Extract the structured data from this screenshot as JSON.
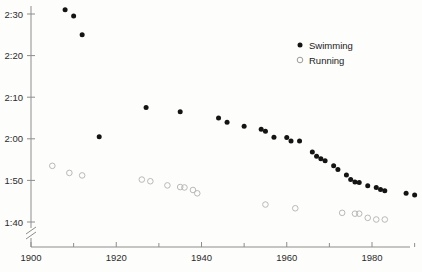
{
  "chart_data": {
    "type": "scatter",
    "title": "",
    "subtitle": "",
    "xlabel": "",
    "ylabel": "",
    "xlim": [
      1900,
      1992
    ],
    "ylim_seconds": [
      98,
      152
    ],
    "y_axis_break": true,
    "y_axis_break_note": "axis broken below 1:40",
    "grid": false,
    "legend_position": "top-right",
    "y_tick_labels": [
      "2:30",
      "2:20",
      "2:10",
      "2:00",
      "1:50",
      "1:40"
    ],
    "y_tick_seconds": [
      150,
      140,
      130,
      120,
      110,
      100
    ],
    "x_tick_labels": [
      "1900",
      "1920",
      "1940",
      "1960",
      "1980"
    ],
    "x_tick_values": [
      1900,
      1920,
      1940,
      1960,
      1980
    ],
    "x_minor_ticks": [
      1910,
      1930,
      1950,
      1970,
      1990
    ],
    "series": [
      {
        "name": "Swimming",
        "marker": "filled-circle",
        "color": "#141414",
        "points": [
          {
            "x": 1908,
            "y_label": "2:31",
            "y": 151.0
          },
          {
            "x": 1910,
            "y_label": "2:29",
            "y": 149.5
          },
          {
            "x": 1912,
            "y_label": "2:25",
            "y": 145.0
          },
          {
            "x": 1916,
            "y_label": "2:20",
            "y": 120.5
          },
          {
            "x": 1927,
            "y_label": "2:07",
            "y": 127.5
          },
          {
            "x": 1935,
            "y_label": "2:06",
            "y": 126.5
          },
          {
            "x": 1944,
            "y_label": "2:05",
            "y": 125.0
          },
          {
            "x": 1946,
            "y_label": "2:04",
            "y": 124.0
          },
          {
            "x": 1950,
            "y_label": "2:03",
            "y": 123.0
          },
          {
            "x": 1954,
            "y_label": "2:02",
            "y": 122.3
          },
          {
            "x": 1955,
            "y_label": "2:02",
            "y": 121.8
          },
          {
            "x": 1957,
            "y_label": "2:00",
            "y": 120.4
          },
          {
            "x": 1960,
            "y_label": "2:00",
            "y": 120.3
          },
          {
            "x": 1961,
            "y_label": "1:59",
            "y": 119.5
          },
          {
            "x": 1963,
            "y_label": "1:59",
            "y": 119.5
          },
          {
            "x": 1966,
            "y_label": "1:57",
            "y": 116.8
          },
          {
            "x": 1967,
            "y_label": "1:56",
            "y": 115.8
          },
          {
            "x": 1968,
            "y_label": "1:55",
            "y": 115.2
          },
          {
            "x": 1969,
            "y_label": "1:55",
            "y": 114.7
          },
          {
            "x": 1971,
            "y_label": "1:54",
            "y": 113.5
          },
          {
            "x": 1972,
            "y_label": "1:53",
            "y": 112.6
          },
          {
            "x": 1974,
            "y_label": "1:52",
            "y": 111.3
          },
          {
            "x": 1975,
            "y_label": "1:51",
            "y": 110.2
          },
          {
            "x": 1976,
            "y_label": "1:50",
            "y": 109.6
          },
          {
            "x": 1977,
            "y_label": "1:50",
            "y": 109.5
          },
          {
            "x": 1979,
            "y_label": "1:49",
            "y": 108.7
          },
          {
            "x": 1981,
            "y_label": "1:49",
            "y": 108.3
          },
          {
            "x": 1982,
            "y_label": "1:48",
            "y": 107.8
          },
          {
            "x": 1983,
            "y_label": "1:48",
            "y": 107.5
          },
          {
            "x": 1988,
            "y_label": "1:47",
            "y": 106.9
          },
          {
            "x": 1990,
            "y_label": "1:47",
            "y": 106.5
          }
        ]
      },
      {
        "name": "Running",
        "marker": "open-circle",
        "color": "#b9b9b9",
        "points": [
          {
            "x": 1905,
            "y_label": "1:54",
            "y": 113.5
          },
          {
            "x": 1909,
            "y_label": "1:52",
            "y": 111.8
          },
          {
            "x": 1912,
            "y_label": "1:51",
            "y": 111.2
          },
          {
            "x": 1926,
            "y_label": "1:50",
            "y": 110.2
          },
          {
            "x": 1928,
            "y_label": "1:50",
            "y": 109.8
          },
          {
            "x": 1932,
            "y_label": "1:49",
            "y": 108.8
          },
          {
            "x": 1935,
            "y_label": "1:48",
            "y": 108.4
          },
          {
            "x": 1936,
            "y_label": "1:48",
            "y": 108.3
          },
          {
            "x": 1938,
            "y_label": "1:48",
            "y": 107.7
          },
          {
            "x": 1939,
            "y_label": "1:47",
            "y": 106.9
          },
          {
            "x": 1955,
            "y_label": "1:44",
            "y": 104.2
          },
          {
            "x": 1962,
            "y_label": "1:43",
            "y": 103.3
          },
          {
            "x": 1973,
            "y_label": "1:42",
            "y": 102.2
          },
          {
            "x": 1976,
            "y_label": "1:42",
            "y": 102.0
          },
          {
            "x": 1977,
            "y_label": "1:42",
            "y": 102.0
          },
          {
            "x": 1979,
            "y_label": "1:41",
            "y": 101.0
          },
          {
            "x": 1981,
            "y_label": "1:41",
            "y": 100.6
          },
          {
            "x": 1983,
            "y_label": "1:41",
            "y": 100.6
          }
        ]
      }
    ],
    "legend": [
      {
        "label": "Swimming",
        "marker": "filled-circle"
      },
      {
        "label": "Running",
        "marker": "open-circle"
      }
    ]
  }
}
